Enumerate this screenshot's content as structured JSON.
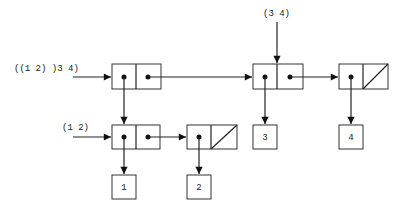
{
  "diagram": {
    "labels": {
      "whole_list": "((1  2) )3 4)",
      "sublist": "(1 2)",
      "tail": "(3 4)"
    },
    "atoms": {
      "a1": "1",
      "a2": "2",
      "a3": "3",
      "a4": "4"
    },
    "cells": [
      {
        "id": "c1",
        "car": "pointer to (1 2)",
        "cdr": "pointer to c2"
      },
      {
        "id": "c2",
        "car": "pointer to 3",
        "cdr": "pointer to c3"
      },
      {
        "id": "c3",
        "car": "pointer to 4",
        "cdr": "nil"
      },
      {
        "id": "c4",
        "car": "pointer to 1",
        "cdr": "pointer to c5"
      },
      {
        "id": "c5",
        "car": "pointer to 2",
        "cdr": "nil"
      }
    ]
  }
}
